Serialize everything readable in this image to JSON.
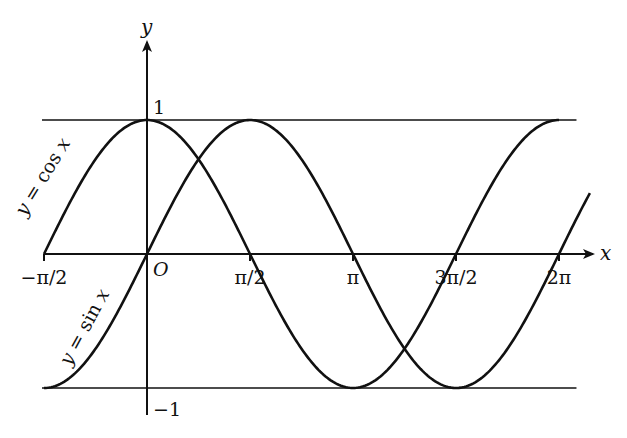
{
  "chart_data": {
    "type": "line",
    "title": "",
    "xlabel": "x",
    "ylabel": "y",
    "origin_label": "O",
    "xlim_units_of_pi": [
      -0.5,
      2.08
    ],
    "ylim": [
      -1,
      1
    ],
    "x_ticks": [
      {
        "value_pi": -0.5,
        "label": "−π/2"
      },
      {
        "value_pi": 0.5,
        "label": "π/2"
      },
      {
        "value_pi": 1.0,
        "label": "π"
      },
      {
        "value_pi": 1.5,
        "label": "3π/2"
      },
      {
        "value_pi": 2.0,
        "label": "2π"
      }
    ],
    "y_ticks": [
      {
        "value": 1,
        "label": "1"
      },
      {
        "value": -1,
        "label": "−1"
      }
    ],
    "reference_lines": [
      {
        "y": 1,
        "x_from_pi": -0.5,
        "x_to_pi": 2.08
      },
      {
        "y": -1,
        "x_from_pi": -0.5,
        "x_to_pi": 2.08
      }
    ],
    "series": [
      {
        "name": "y = cos x",
        "func": "cos",
        "x_from_pi": -0.5,
        "x_to_pi": 2.0,
        "label": "y = cos x",
        "label_at_pi": -0.3
      },
      {
        "name": "y = sin x",
        "func": "sin",
        "x_from_pi": -0.5,
        "x_to_pi": 2.15,
        "label": "y = sin x",
        "label_at_pi": -0.15
      }
    ],
    "grid": false,
    "legend": "none"
  }
}
